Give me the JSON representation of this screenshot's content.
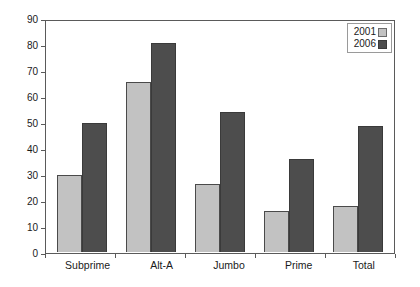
{
  "chart_data": {
    "type": "bar",
    "title": "",
    "xlabel": "",
    "ylabel": "",
    "ylim": [
      0,
      90
    ],
    "yticks": [
      0,
      10,
      20,
      30,
      40,
      50,
      60,
      70,
      80,
      90
    ],
    "grid": false,
    "legend_position": "top-right",
    "categories": [
      "Subprime",
      "Alt-A",
      "Jumbo",
      "Prime",
      "Total"
    ],
    "series": [
      {
        "name": "2001",
        "color": "#c2c2c2",
        "values": [
          30,
          66,
          26.5,
          16,
          18
        ]
      },
      {
        "name": "2006",
        "color": "#4d4d4d",
        "values": [
          50,
          81,
          54.5,
          36,
          49
        ]
      }
    ]
  },
  "legend": {
    "items": [
      {
        "label": "2001"
      },
      {
        "label": "2006"
      }
    ]
  },
  "axis": {
    "y_tick_labels": [
      "90",
      "80",
      "70",
      "60",
      "50",
      "40",
      "30",
      "20",
      "10",
      "0"
    ]
  }
}
